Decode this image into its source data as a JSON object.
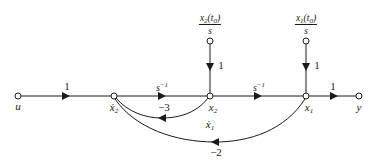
{
  "diagram": {
    "type": "signal-flow-graph",
    "nodes": [
      {
        "id": "u",
        "label": "u",
        "x": 18,
        "y": 96
      },
      {
        "id": "x2dot",
        "label": "ẋ",
        "sub": "2",
        "x": 114,
        "y": 96
      },
      {
        "id": "x2",
        "label": "x",
        "sub": "2",
        "x": 210,
        "y": 96
      },
      {
        "id": "x1",
        "label": "x",
        "sub": "1",
        "x": 306,
        "y": 96
      },
      {
        "id": "y",
        "label": "y",
        "x": 359,
        "y": 96
      },
      {
        "id": "x2_init",
        "x": 210,
        "y": 41
      },
      {
        "id": "x1_init",
        "x": 306,
        "y": 41
      }
    ],
    "initial_conditions": {
      "x2": {
        "num": "x",
        "num_sub": "2",
        "num_arg": "(t",
        "num_arg_sub": "0",
        "num_close": ")",
        "den": "s"
      },
      "x1": {
        "num": "x",
        "num_sub": "1",
        "num_arg": "(t",
        "num_arg_sub": "0",
        "num_close": ")",
        "den": "s"
      }
    },
    "branch_gains": {
      "u_to_x2dot": "1",
      "x2dot_to_x2": "s",
      "x2dot_to_x2_exp": "−1",
      "x2_to_x1": "s",
      "x2_to_x1_exp": "−1",
      "x1_to_y": "1",
      "x2init_to_x2": "1",
      "x1init_to_x1": "1",
      "x2_to_x2dot": "−3",
      "x1_to_x2dot": "−2"
    },
    "extra_label": {
      "label": "ẋ",
      "sub": "1"
    }
  }
}
